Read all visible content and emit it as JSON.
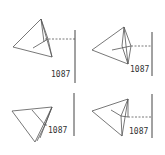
{
  "diagram": {
    "panels": [
      {
        "id": "top-left",
        "label": "1087"
      },
      {
        "id": "top-right",
        "label": "1087"
      },
      {
        "id": "bottom-left",
        "label": "1087"
      },
      {
        "id": "bottom-right",
        "label": "1087"
      }
    ]
  }
}
